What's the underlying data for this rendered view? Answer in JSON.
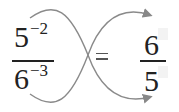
{
  "diagram": {
    "left_fraction": {
      "numerator_base": "5",
      "numerator_exponent": "−2",
      "denominator_base": "6",
      "denominator_exponent": "−3"
    },
    "equals_sign": "=",
    "right_fraction": {
      "numerator": "6",
      "denominator": "5"
    },
    "arrow_color": "#888888",
    "text_color": "#222222"
  }
}
